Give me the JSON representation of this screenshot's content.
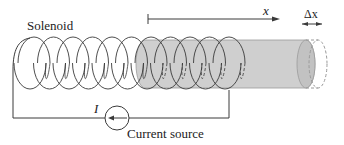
{
  "diagram": {
    "labels": {
      "solenoid": "Solenoid",
      "x_axis": "x",
      "delta_x": "Δx",
      "current": "I",
      "current_source": "Current source"
    },
    "colors": {
      "line": "#3a3a3a",
      "rod_fill": "#cfcfcf",
      "rod_edge": "#9a9a9a",
      "dashed": "#9a9a9a"
    },
    "coils": {
      "count": 11,
      "start_x": 30,
      "spacing": 19.5,
      "rx": 16,
      "ry": 26,
      "cy": 63
    },
    "rod": {
      "x1": 145,
      "x2": 306,
      "y_top": 40,
      "y_bottom": 88
    },
    "current_source": {
      "cx": 117,
      "cy": 118,
      "r": 12,
      "arrow_direction": "left"
    }
  }
}
